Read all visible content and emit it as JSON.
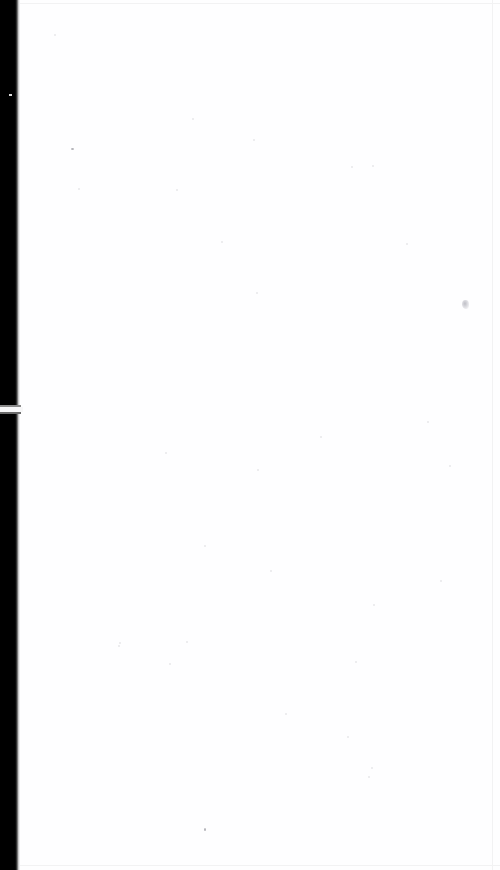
{
  "document": {
    "kind": "scanned-page",
    "page_content_text": "",
    "page_state_label": "blank",
    "page_background_color": "#ffffff",
    "paper_tint_color": "#fefeff"
  },
  "gutter": {
    "label": "scan-gutter-shadow",
    "color": "#000000",
    "falloff_color": "#6d6d6d",
    "edge_rule_color": "#ececed",
    "light_gap_label": "gutter-light-break",
    "light_gap_color": "#f7f7f8",
    "nick_label": "gutter-edge-nick",
    "nick_color": "#d8d8d8"
  },
  "page_borders": {
    "rule_color": "#f2f2f3",
    "top_label": "page-top-edge",
    "bottom_label": "page-bottom-edge",
    "right_label": "page-right-edge"
  },
  "artifacts": {
    "speck_color": "#cfcfd4",
    "speck_faint_color": "#e7e7ea",
    "speck_dark_color": "#b2b2b8",
    "smudge_label": "scan-smudge",
    "smudge_color": "#bfbfc6",
    "specks": [
      {
        "x": 54,
        "y": 34,
        "w": 2,
        "h": 2,
        "tone": "faint"
      },
      {
        "x": 71,
        "y": 148,
        "w": 3,
        "h": 2,
        "tone": "dark"
      },
      {
        "x": 192,
        "y": 118,
        "w": 2,
        "h": 2,
        "tone": "faint"
      },
      {
        "x": 253,
        "y": 139,
        "w": 2,
        "h": 2,
        "tone": "faint"
      },
      {
        "x": 176,
        "y": 189,
        "w": 2,
        "h": 2,
        "tone": "faint"
      },
      {
        "x": 78,
        "y": 188,
        "w": 2,
        "h": 2,
        "tone": "faint"
      },
      {
        "x": 221,
        "y": 241,
        "w": 2,
        "h": 2,
        "tone": "faint"
      },
      {
        "x": 406,
        "y": 243,
        "w": 2,
        "h": 2,
        "tone": "faint"
      },
      {
        "x": 372,
        "y": 165,
        "w": 2,
        "h": 2,
        "tone": "faint"
      },
      {
        "x": 351,
        "y": 166,
        "w": 2,
        "h": 2,
        "tone": "faint"
      },
      {
        "x": 256,
        "y": 292,
        "w": 2,
        "h": 2,
        "tone": "faint"
      },
      {
        "x": 320,
        "y": 436,
        "w": 2,
        "h": 2,
        "tone": "faint"
      },
      {
        "x": 165,
        "y": 452,
        "w": 2,
        "h": 2,
        "tone": "faint"
      },
      {
        "x": 257,
        "y": 469,
        "w": 2,
        "h": 2,
        "tone": "faint"
      },
      {
        "x": 427,
        "y": 421,
        "w": 2,
        "h": 2,
        "tone": "faint"
      },
      {
        "x": 449,
        "y": 465,
        "w": 2,
        "h": 2,
        "tone": "faint"
      },
      {
        "x": 204,
        "y": 545,
        "w": 2,
        "h": 2,
        "tone": "faint"
      },
      {
        "x": 270,
        "y": 570,
        "w": 2,
        "h": 2,
        "tone": "faint"
      },
      {
        "x": 373,
        "y": 604,
        "w": 2,
        "h": 2,
        "tone": "faint"
      },
      {
        "x": 119,
        "y": 642,
        "w": 2,
        "h": 2,
        "tone": "faint"
      },
      {
        "x": 169,
        "y": 663,
        "w": 2,
        "h": 2,
        "tone": "faint"
      },
      {
        "x": 355,
        "y": 661,
        "w": 2,
        "h": 2,
        "tone": "faint"
      },
      {
        "x": 118,
        "y": 645,
        "w": 2,
        "h": 2,
        "tone": "faint"
      },
      {
        "x": 186,
        "y": 641,
        "w": 2,
        "h": 2,
        "tone": "faint"
      },
      {
        "x": 347,
        "y": 736,
        "w": 2,
        "h": 2,
        "tone": "faint"
      },
      {
        "x": 368,
        "y": 776,
        "w": 2,
        "h": 2,
        "tone": "faint"
      },
      {
        "x": 204,
        "y": 828,
        "w": 2,
        "h": 3,
        "tone": "dark"
      },
      {
        "x": 371,
        "y": 767,
        "w": 2,
        "h": 2,
        "tone": "faint"
      },
      {
        "x": 440,
        "y": 580,
        "w": 2,
        "h": 2,
        "tone": "faint"
      },
      {
        "x": 285,
        "y": 713,
        "w": 2,
        "h": 2,
        "tone": "faint"
      }
    ]
  }
}
